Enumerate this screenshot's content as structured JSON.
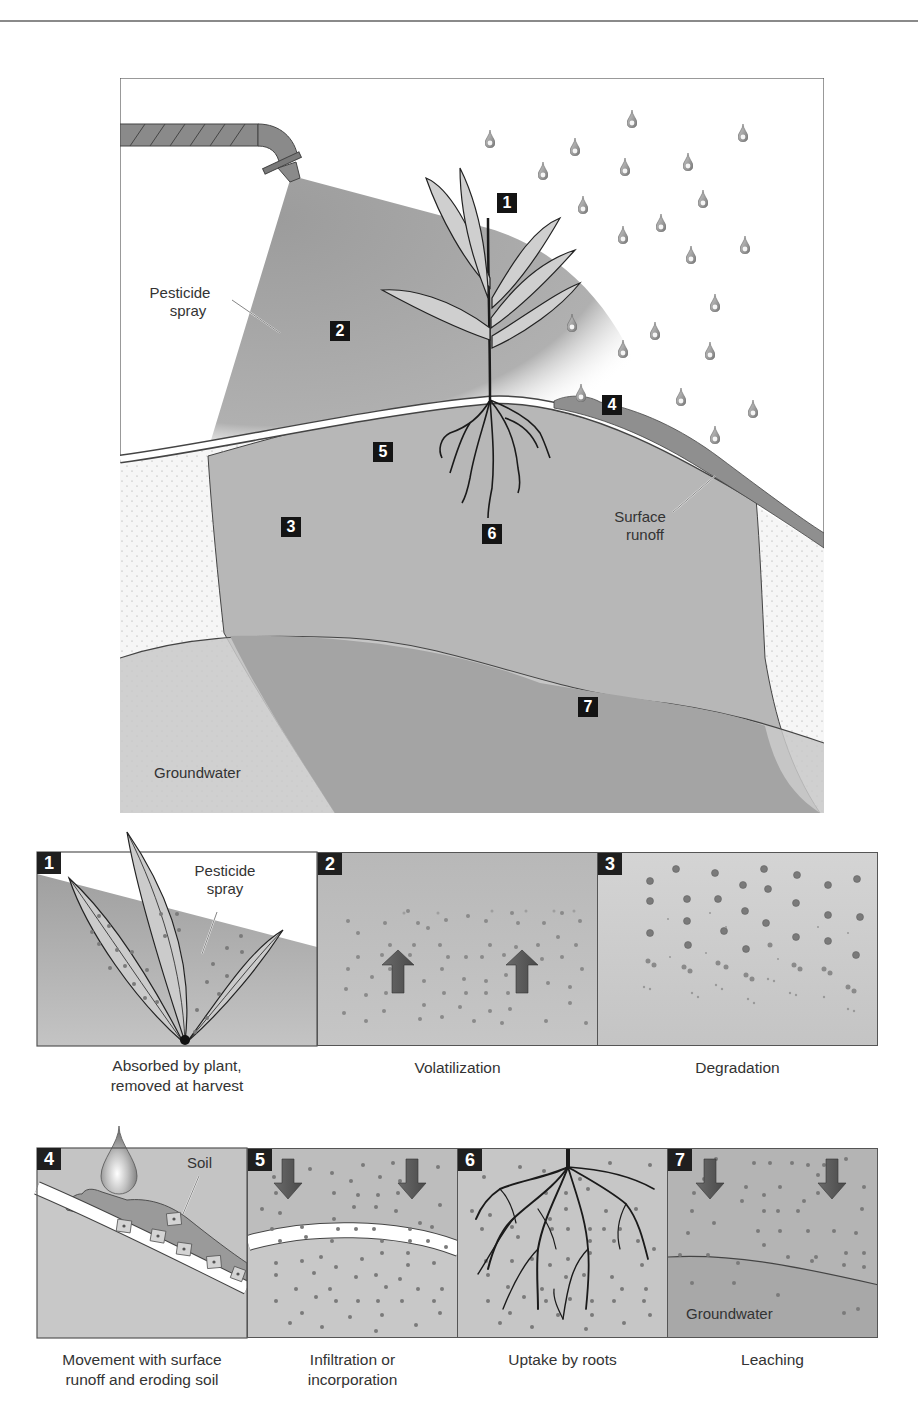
{
  "figure": {
    "main": {
      "labels": {
        "pesticide_spray": [
          "Pesticide",
          "spray"
        ],
        "surface_runoff": [
          "Surface",
          "runoff"
        ],
        "groundwater": "Groundwater"
      },
      "badges": [
        "1",
        "2",
        "3",
        "4",
        "5",
        "6",
        "7"
      ]
    },
    "panels": [
      {
        "number": "1",
        "caption": [
          "Absorbed by plant,",
          "removed at harvest"
        ],
        "inner_label": [
          "Pesticide",
          "spray"
        ]
      },
      {
        "number": "2",
        "caption": [
          "Volatilization"
        ]
      },
      {
        "number": "3",
        "caption": [
          "Degradation"
        ]
      },
      {
        "number": "4",
        "caption": [
          "Movement with surface",
          "runoff and eroding soil"
        ],
        "inner_label": [
          "Soil"
        ]
      },
      {
        "number": "5",
        "caption": [
          "Infiltration or",
          "incorporation"
        ]
      },
      {
        "number": "6",
        "caption": [
          "Uptake by roots"
        ]
      },
      {
        "number": "7",
        "caption": [
          "Leaching"
        ],
        "inner_label": [
          "Groundwater"
        ]
      }
    ],
    "colors": {
      "spray": "#9a9a9a",
      "soil": "#b9b9b9",
      "leach_zone": "#a8a8a8",
      "groundwater": "#c9c9c9",
      "sand": "#f4f4f4",
      "badge": "#141414",
      "outline": "#444444"
    }
  }
}
